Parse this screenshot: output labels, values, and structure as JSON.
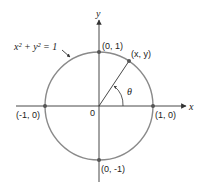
{
  "diagram": {
    "equation": "x² + y² = 1",
    "axes": {
      "x_label": "x",
      "y_label": "y"
    },
    "origin_label": "0",
    "points": [
      {
        "label": "(0, 1)"
      },
      {
        "label": "(x, y)"
      },
      {
        "label": "(-1, 0)"
      },
      {
        "label": "(1, 0)"
      },
      {
        "label": "(0, -1)"
      }
    ],
    "angle_label": "θ",
    "colors": {
      "circle": "#8a8a8a",
      "axes": "#333333",
      "points": "#555555"
    }
  }
}
